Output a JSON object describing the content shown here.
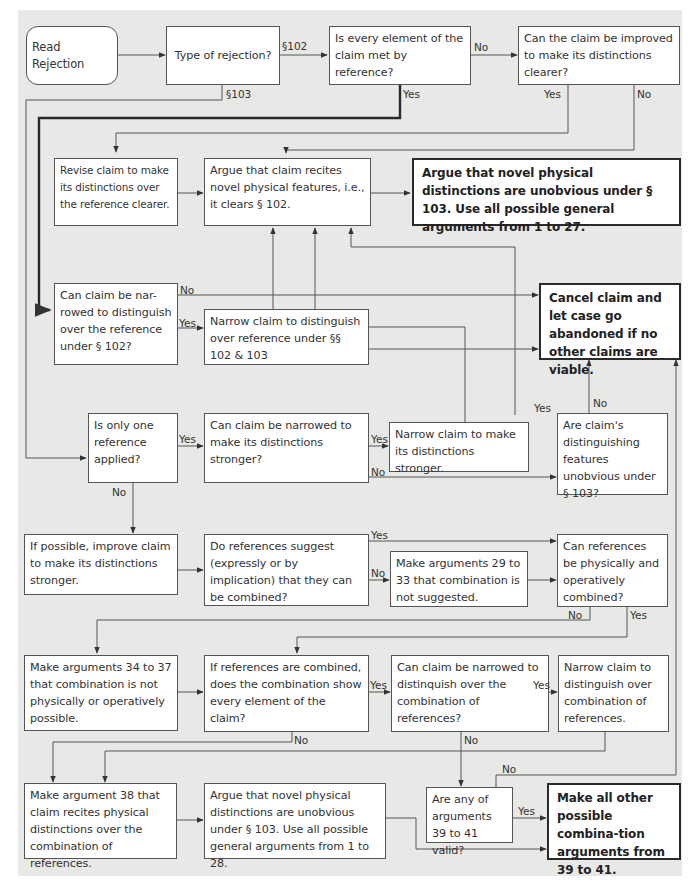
{
  "colors": {
    "background": "#e8e8e6",
    "box_fill": "#ffffff",
    "line": "#555555",
    "bold_line": "#2a2a2a"
  },
  "nodes": {
    "read_rejection": "Read Rejection",
    "type_of_rejection": "Type of rejection?",
    "every_element_met": "Is every element of the claim met by reference?",
    "can_improve_clearer": "Can the claim be improved to make its distinctions clearer?",
    "revise_claim": "Revise claim to make its distinctions over the reference clearer.",
    "argue_novel_features": "Argue that claim recites novel physical features, i.e., it clears § 102.",
    "argue_unobvious_103_27": "Argue that novel physical distinctions are unobvious under § 103. Use all possible general arguments from 1 to 27.",
    "can_narrow_102": "Can claim be nar-rowed to distinguish over the reference under § 102?",
    "narrow_102_103": "Narrow claim to distinguish over reference under §§ 102 & 103",
    "cancel_claim": "Cancel claim and let case go abandoned if no other claims are viable.",
    "only_one_reference": "Is only one reference applied?",
    "can_narrow_stronger": "Can claim be narrowed to make its distinctions stronger?",
    "narrow_stronger": "Narrow claim to  make its distinctions stronger.",
    "features_unobvious_103": "Are claim's distinguishing features unobvious under § 103?",
    "improve_claim": "If possible, improve  claim to make its distinctions stronger.",
    "references_suggest": "Do references suggest (expressly or by implication) that they can be combined?",
    "arguments_29_33": "Make arguments 29 to 33 that combination is not suggested.",
    "can_physically_combine": "Can references be physically and operatively combined?",
    "arguments_34_37": "Make arguments 34 to 37 that combination is not physically or operatively possible.",
    "combination_every_element": "If references are combined, does the combination show every element of the claim?",
    "can_narrow_combination": "Can claim be narrowed to distinquish over the combination of references?",
    "narrow_combination": "Narrow claim to distinguish over combination of references.",
    "argument_38": "Make argument 38 that claim recites physical distinctions over the combination of references.",
    "argue_unobvious_103_28": "Argue that novel physical distinctions are unobvious under § 103. Use all possible general arguments from 1 to 28.",
    "arguments_39_41_valid": "Are any of arguments 39 to 41 valid?",
    "combination_args_39_41": "Make all other possible combina-tion arguments from 39 to 41."
  },
  "labels": {
    "s102": "§102",
    "s103": "§103",
    "yes": "Yes",
    "no": "No"
  }
}
